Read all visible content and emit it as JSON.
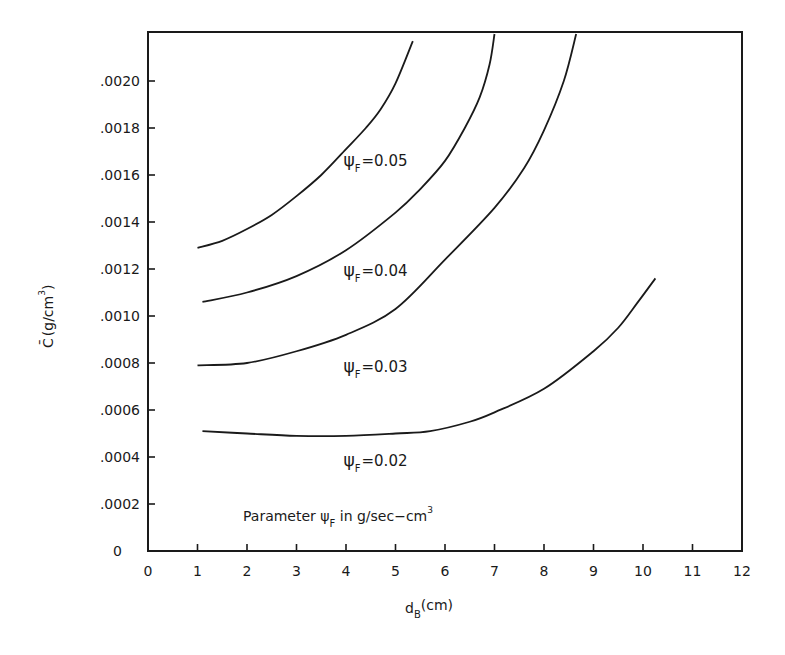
{
  "chart_data": {
    "type": "line",
    "title": "",
    "xlabel": "d_B (cm)",
    "xlabel_main": "d",
    "xlabel_sub": "B",
    "xlabel_units": "(cm)",
    "ylabel": "C̄ (g/cm³)",
    "ylabel_main": "C̄",
    "ylabel_units": "(g/cm",
    "ylabel_sup": "3",
    "ylabel_close": ")",
    "xlim": [
      0,
      12
    ],
    "ylim": [
      0,
      0.0022
    ],
    "xticks": [
      0,
      1,
      2,
      3,
      4,
      5,
      6,
      7,
      8,
      9,
      10,
      11,
      12
    ],
    "xtick_labels": [
      "0",
      "1",
      "2",
      "3",
      "4",
      "5",
      "6",
      "7",
      "8",
      "9",
      "10",
      "11",
      "12"
    ],
    "yticks": [
      0,
      0.0002,
      0.0004,
      0.0006,
      0.0008,
      0.001,
      0.0012,
      0.0014,
      0.0016,
      0.0018,
      0.002
    ],
    "ytick_labels": [
      "0",
      ".0002",
      ".0004",
      ".0006",
      ".0008",
      ".0010",
      ".0012",
      ".0014",
      ".0016",
      ".0018",
      ".0020"
    ],
    "grid": false,
    "legend": "inline labels",
    "annotation": {
      "prefix": "Parameter ψ",
      "sub": "F",
      "suffix": " in g/sec−cm",
      "sup": "3"
    },
    "series": [
      {
        "name": "ψF = 0.05",
        "label_symbol": "ψ",
        "label_sub": "F",
        "label_value": "=0.05",
        "label_pos": [
          3.95,
          0.00164
        ],
        "x": [
          1.0,
          1.5,
          2.0,
          2.5,
          3.0,
          3.5,
          4.0,
          4.4,
          4.7,
          5.0,
          5.35
        ],
        "y": [
          0.00129,
          0.00132,
          0.00137,
          0.00143,
          0.00151,
          0.0016,
          0.00171,
          0.0018,
          0.00188,
          0.00199,
          0.00217
        ]
      },
      {
        "name": "ψF = 0.04",
        "label_symbol": "ψ",
        "label_sub": "F",
        "label_value": "=0.04",
        "label_pos": [
          3.95,
          0.00117
        ],
        "x": [
          1.1,
          2.0,
          3.0,
          4.0,
          5.0,
          5.5,
          6.0,
          6.4,
          6.7,
          6.9,
          7.0
        ],
        "y": [
          0.00106,
          0.0011,
          0.00117,
          0.00128,
          0.00144,
          0.00154,
          0.00166,
          0.0018,
          0.00193,
          0.00207,
          0.0022
        ]
      },
      {
        "name": "ψF = 0.03",
        "label_symbol": "ψ",
        "label_sub": "F",
        "label_value": "=0.03",
        "label_pos": [
          3.95,
          0.00076
        ],
        "x": [
          1.0,
          2.0,
          3.0,
          4.0,
          5.0,
          6.0,
          7.0,
          7.6,
          8.0,
          8.4,
          8.65
        ],
        "y": [
          0.00079,
          0.0008,
          0.00085,
          0.00092,
          0.00103,
          0.00124,
          0.00146,
          0.00163,
          0.00179,
          0.002,
          0.0022
        ]
      },
      {
        "name": "ψF = 0.02",
        "label_symbol": "ψ",
        "label_sub": "F",
        "label_value": "=0.02",
        "label_pos": [
          3.95,
          0.00036
        ],
        "x": [
          1.1,
          2.0,
          3.0,
          4.0,
          5.0,
          5.7,
          6.5,
          7.0,
          8.0,
          9.0,
          9.5,
          9.9,
          10.25
        ],
        "y": [
          0.00051,
          0.0005,
          0.00049,
          0.00049,
          0.0005,
          0.00051,
          0.00055,
          0.00059,
          0.00069,
          0.00085,
          0.00095,
          0.00106,
          0.00116
        ]
      }
    ]
  },
  "layout_px": {
    "x0": 148,
    "x_per_unit": 49.5,
    "y0": 551,
    "y_per_0001": 235,
    "frame_top": 32
  }
}
